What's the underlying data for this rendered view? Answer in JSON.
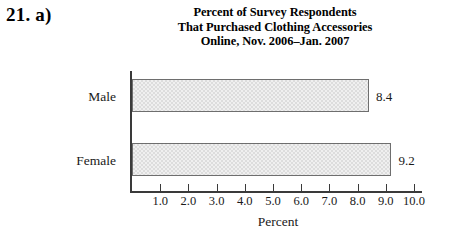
{
  "problem": {
    "number_label": "21. a)"
  },
  "figure": {
    "title_lines": [
      "Percent of Survey Respondents",
      "That Purchased Clothing Accessories",
      "Online, Nov. 2006–Jan. 2007"
    ],
    "x_axis_title": "Percent",
    "colors": {
      "bar_fill": "#dddddd",
      "bar_border": "#6e6e6e",
      "axis": "#3a3a3a",
      "text": "#1a1a1a",
      "background": "#ffffff"
    }
  },
  "chart_data": {
    "type": "bar",
    "orientation": "horizontal",
    "title": "Percent of Survey Respondents That Purchased Clothing Accessories Online, Nov. 2006–Jan. 2007",
    "categories": [
      "Male",
      "Female"
    ],
    "values": [
      8.4,
      9.2
    ],
    "value_labels": [
      "8.4",
      "9.2"
    ],
    "xlabel": "Percent",
    "ylabel": "",
    "xlim": [
      0,
      10.4
    ],
    "xticks": [
      1.0,
      2.0,
      3.0,
      4.0,
      5.0,
      6.0,
      7.0,
      8.0,
      9.0,
      10.0
    ],
    "xtick_labels": [
      "1.0",
      "2.0",
      "3.0",
      "4.0",
      "5.0",
      "6.0",
      "7.0",
      "8.0",
      "9.0",
      "10.0"
    ],
    "grid": false,
    "legend": false
  }
}
